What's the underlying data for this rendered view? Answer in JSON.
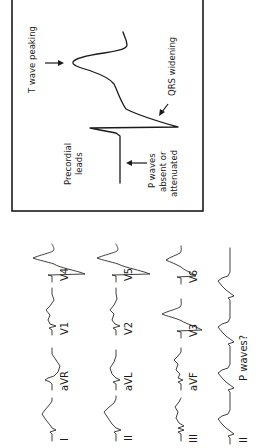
{
  "figure": {
    "orientation": "rotated 90 degrees counter-clockwise (text reads bottom-to-top)",
    "background": "#ffffff",
    "line_color": "#1a1a1a"
  },
  "inset": {
    "title_labels": {
      "t_wave": "T wave peaking",
      "qrs": "QRS widening",
      "precordial_line1": "Precordial",
      "precordial_line2": "leads",
      "p_line1": "P waves",
      "p_line2": "absent or",
      "p_line3": "attenuated"
    }
  },
  "leads": {
    "row1": [
      {
        "id": "I",
        "label": "I"
      },
      {
        "id": "aVR",
        "label": "aVR"
      },
      {
        "id": "V1",
        "label": "V1"
      },
      {
        "id": "V4",
        "label": "V4"
      }
    ],
    "row2": [
      {
        "id": "II",
        "label": "II"
      },
      {
        "id": "aVL",
        "label": "aVL"
      },
      {
        "id": "V2",
        "label": "V2"
      },
      {
        "id": "V5",
        "label": "V5"
      }
    ],
    "row3": [
      {
        "id": "III",
        "label": "III"
      },
      {
        "id": "aVF",
        "label": "aVF"
      },
      {
        "id": "V3",
        "label": "V3"
      },
      {
        "id": "V6",
        "label": "V6"
      }
    ],
    "rhythm": {
      "label": "II",
      "annotation": "P waves?"
    }
  }
}
